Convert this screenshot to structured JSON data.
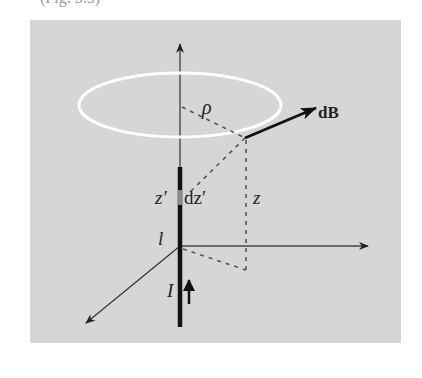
{
  "caption_fragment": "(Fig.  5.3)",
  "diagram": {
    "background_color": "#d6d6d6",
    "loop_color": "#ffffff",
    "wire_color": "#111111",
    "dz_segment_color": "#8a8a8a",
    "labels": {
      "rho": "ρ",
      "dB": "dB",
      "z_prime": "z′",
      "dz_prime": "dz′",
      "z": "z",
      "l": "l",
      "current": "I"
    },
    "elements": [
      {
        "name": "vertical-axis",
        "type": "arrow",
        "from": [
          180,
          246
        ],
        "to": [
          180,
          42
        ]
      },
      {
        "name": "horizontal-axis",
        "type": "arrow",
        "from": [
          180,
          246
        ],
        "to": [
          368,
          246
        ]
      },
      {
        "name": "diagonal-axis",
        "type": "arrow",
        "from": [
          180,
          246
        ],
        "to": [
          85,
          324
        ]
      },
      {
        "name": "current-loop",
        "type": "ellipse",
        "cx": 180,
        "cy": 105,
        "rx": 101,
        "ry": 32
      },
      {
        "name": "wire",
        "type": "thick-line",
        "from": [
          180,
          167
        ],
        "to": [
          180,
          327
        ]
      },
      {
        "name": "dB-vector",
        "type": "arrow",
        "from": [
          245,
          138
        ],
        "to": [
          316,
          108
        ]
      },
      {
        "name": "current-arrow",
        "type": "arrow",
        "from": [
          189,
          304
        ],
        "to": [
          189,
          277
        ]
      }
    ]
  }
}
